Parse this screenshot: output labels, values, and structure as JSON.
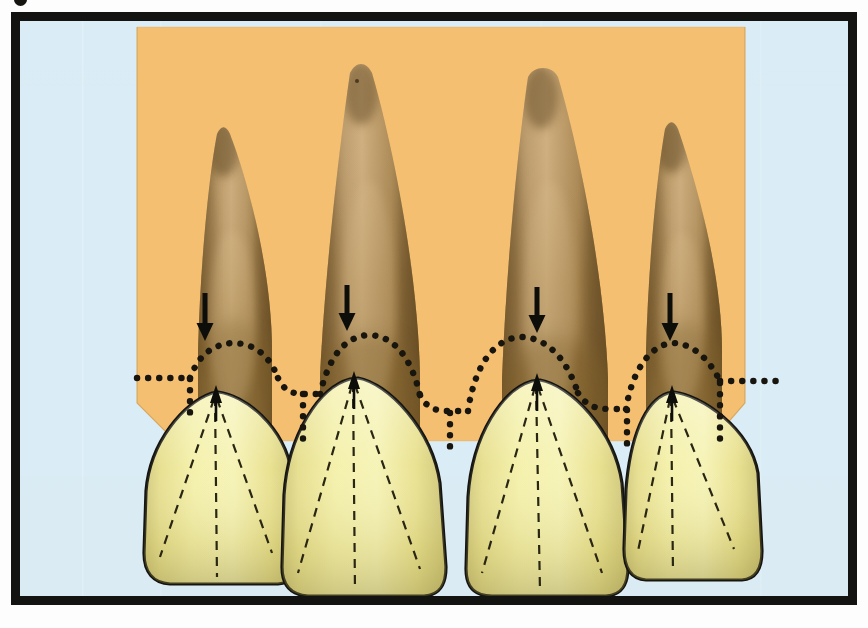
{
  "figure": {
    "kind": "anatomical-illustration",
    "caption_fragment_visible": "g",
    "frame": {
      "border_color": "#131311",
      "border_width_px": 9
    },
    "canvas": {
      "width": 868,
      "height": 628
    }
  },
  "palette": {
    "page_background": "#fdfdfd",
    "plate_background": "#daecf5",
    "panel_background": "#f5bc6a",
    "root_light": "#cdab75",
    "root_mid": "#b48f55",
    "root_dark": "#8b6b3a",
    "root_shadow": "#6d5226",
    "crown_light": "#f6f3b2",
    "crown_mid": "#eee98e",
    "crown_shade": "#d9d07a",
    "outline": "#15140f",
    "dotted_line": "#17150d",
    "dashed_line": "#2a2614",
    "arrow": "#0d0d0a"
  },
  "panel": {
    "name": "orange-backdrop-panel",
    "left": 137,
    "top": 26,
    "right": 745,
    "bottom_edge": 440,
    "notch_left_x": 175,
    "notch_right_x": 712
  },
  "legend": {
    "dotted_line_meaning": "cementoenamel junction / gingival scallop",
    "arrow_meaning": "points to the cementoenamel junction",
    "dashed_line_meaning": "developmental lobes of the crown"
  },
  "teeth": [
    {
      "id": "tooth-1",
      "label": "lateral incisor left",
      "root_apex_x": 208,
      "root_apex_y": 138,
      "crown_left": 145,
      "crown_right": 292,
      "crown_apex_x": 212,
      "crown_apex_y": 392,
      "crown_bottom_y": 580,
      "cej_peak_x": 212,
      "cej_peak_y": 344,
      "arrow_x": 205,
      "arrow_top_y": 292,
      "arrow_bottom_y": 340,
      "lobe_lines": 3
    },
    {
      "id": "tooth-2",
      "label": "central incisor left",
      "root_apex_x": 355,
      "root_apex_y": 74,
      "crown_left": 296,
      "crown_right": 458,
      "crown_apex_x": 350,
      "crown_apex_y": 378,
      "crown_bottom_y": 592,
      "cej_peak_x": 350,
      "cej_peak_y": 334,
      "arrow_x": 347,
      "arrow_top_y": 284,
      "arrow_bottom_y": 330,
      "lobe_lines": 3
    },
    {
      "id": "tooth-3",
      "label": "central incisor right",
      "root_apex_x": 532,
      "root_apex_y": 78,
      "crown_left": 461,
      "crown_right": 621,
      "crown_apex_x": 540,
      "crown_apex_y": 380,
      "crown_bottom_y": 592,
      "cej_peak_x": 540,
      "cej_peak_y": 336,
      "arrow_x": 537,
      "arrow_top_y": 286,
      "arrow_bottom_y": 332,
      "lobe_lines": 3
    },
    {
      "id": "tooth-4",
      "label": "lateral incisor right",
      "root_apex_x": 666,
      "root_apex_y": 134,
      "crown_left": 623,
      "crown_right": 748,
      "crown_apex_x": 672,
      "crown_apex_y": 392,
      "crown_bottom_y": 576,
      "cej_peak_x": 672,
      "cej_peak_y": 344,
      "arrow_x": 670,
      "arrow_top_y": 292,
      "arrow_bottom_y": 340,
      "lobe_lines": 3
    }
  ],
  "arrows": {
    "name": "cej-pointer-arrows",
    "count": 4,
    "direction": "down",
    "shaft_width_px": 5,
    "head_width_px": 17,
    "head_height_px": 17
  },
  "crown_apex_arrows": {
    "name": "crown-apex-arrows",
    "count": 4,
    "direction": "up",
    "note": "short arrow inside each crown pointing up to the cusp apex"
  },
  "dotted_cej": {
    "name": "cej-dotted-line",
    "dot_radius_px": 3.2,
    "spacing_px": 11,
    "description": "scalloped dotted outline following the cementoenamel junction, dipping interproximally and running horizontally off each side of the panel"
  }
}
